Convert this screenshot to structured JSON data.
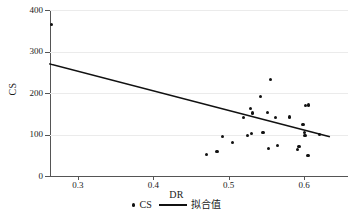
{
  "chart_data": {
    "type": "scatter",
    "title": "",
    "xlabel": "DR",
    "ylabel": "CS",
    "xlim": [
      0.2632,
      0.658
    ],
    "ylim": [
      0,
      400
    ],
    "grid": true,
    "x_ticks": [
      "0.3",
      "0.4",
      "0.5",
      "0.6"
    ],
    "x_tick_values": [
      0.3,
      0.4,
      0.5,
      0.6
    ],
    "y_ticks": [
      "0",
      "100",
      "200",
      "300",
      "400"
    ],
    "y_tick_values": [
      0,
      100,
      200,
      300,
      400
    ],
    "legend_position": "bottom-center",
    "legend": [
      {
        "label": "CS",
        "marker": "dot"
      },
      {
        "label": "拟合值",
        "marker": "line"
      }
    ],
    "series": [
      {
        "name": "CS",
        "marker": "dot",
        "color": "#111111",
        "points": [
          {
            "x": 0.265,
            "y": 365
          },
          {
            "x": 0.47,
            "y": 52
          },
          {
            "x": 0.4845,
            "y": 60
          },
          {
            "x": 0.492,
            "y": 95
          },
          {
            "x": 0.5045,
            "y": 80
          },
          {
            "x": 0.5195,
            "y": 140
          },
          {
            "x": 0.5245,
            "y": 98
          },
          {
            "x": 0.5285,
            "y": 163
          },
          {
            "x": 0.53,
            "y": 103
          },
          {
            "x": 0.5315,
            "y": 152
          },
          {
            "x": 0.542,
            "y": 192
          },
          {
            "x": 0.5455,
            "y": 104
          },
          {
            "x": 0.551,
            "y": 153
          },
          {
            "x": 0.553,
            "y": 66
          },
          {
            "x": 0.5555,
            "y": 232
          },
          {
            "x": 0.562,
            "y": 141
          },
          {
            "x": 0.5645,
            "y": 73
          },
          {
            "x": 0.58,
            "y": 142
          },
          {
            "x": 0.5915,
            "y": 64
          },
          {
            "x": 0.593,
            "y": 72
          },
          {
            "x": 0.5985,
            "y": 124
          },
          {
            "x": 0.6005,
            "y": 104
          },
          {
            "x": 0.601,
            "y": 98
          },
          {
            "x": 0.6015,
            "y": 170
          },
          {
            "x": 0.606,
            "y": 171
          },
          {
            "x": 0.605,
            "y": 50
          },
          {
            "x": 0.62,
            "y": 100
          }
        ]
      },
      {
        "name": "拟合值",
        "marker": "line",
        "color": "#111111",
        "line": {
          "x1": 0.2632,
          "y1": 270,
          "x2": 0.633,
          "y2": 95
        }
      }
    ]
  },
  "axes": {
    "y_title": "CS",
    "x_title": "DR"
  },
  "colors": {
    "marker": "#111111",
    "line": "#111111",
    "axis": "#555555",
    "grid": "#ebebeb",
    "background": "#ffffff"
  }
}
